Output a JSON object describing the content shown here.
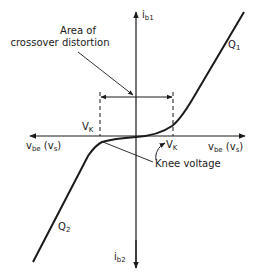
{
  "diagram": {
    "labels": {
      "area_line1": "Area of",
      "area_line2": "crossover distortion",
      "knee_voltage": "Knee voltage",
      "vk_left_main": "V",
      "vk_left_sub": "K",
      "vk_right_main": "V",
      "vk_right_sub": "K",
      "ib1_main": "i",
      "ib1_sub": "b1",
      "ib2_main": "i",
      "ib2_sub": "b2",
      "vbe_left_main": "v",
      "vbe_left_sub": "be",
      "vbe_left_paren": "(v",
      "vbe_left_paren_sub": "s",
      "vbe_left_close": ")",
      "vbe_right_main": "v",
      "vbe_right_sub": "be",
      "vbe_right_paren": "(v",
      "vbe_right_paren_sub": "s",
      "vbe_right_close": ")",
      "q1_main": "Q",
      "q1_sub": "1",
      "q2_main": "Q",
      "q2_sub": "2"
    },
    "colors": {
      "ink": "#1a1a1a",
      "background": "#ffffff"
    }
  }
}
